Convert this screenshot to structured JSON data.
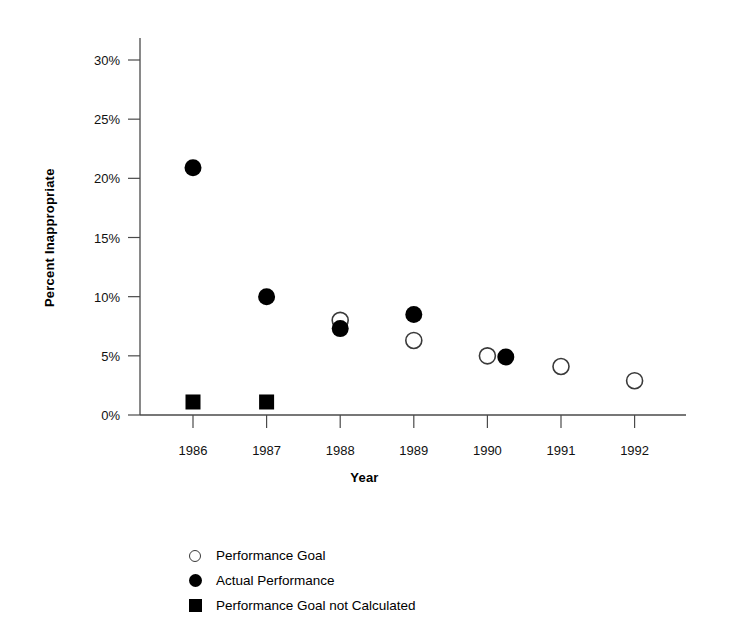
{
  "chart_data": {
    "type": "scatter",
    "title": "",
    "xlabel": "Year",
    "ylabel": "Percent Inappropriate",
    "x": [
      1986,
      1987,
      1988,
      1989,
      1990,
      1991,
      1992
    ],
    "categories": [
      "1986",
      "1987",
      "1988",
      "1989",
      "1990",
      "1991",
      "1992"
    ],
    "xlim": [
      1985.5,
      1992.6
    ],
    "ylim": [
      0,
      30
    ],
    "y_ticks": [
      0,
      5,
      10,
      15,
      20,
      25,
      30
    ],
    "y_tick_labels": [
      "0%",
      "5%",
      "10%",
      "15%",
      "20%",
      "25%",
      "30%"
    ],
    "x_ticks": [
      1986,
      1987,
      1988,
      1989,
      1990,
      1991,
      1992
    ],
    "x_tick_labels": [
      "1986",
      "1987",
      "1988",
      "1989",
      "1990",
      "1991",
      "1992"
    ],
    "grid": false,
    "legend_position": "bottom-left",
    "series": [
      {
        "name": "Performance Goal",
        "marker": "open-circle",
        "color": "#3a3a3a",
        "points": [
          {
            "x": 1988,
            "y": 8.0
          },
          {
            "x": 1989,
            "y": 6.3
          },
          {
            "x": 1990,
            "y": 5.0
          },
          {
            "x": 1991,
            "y": 4.1
          },
          {
            "x": 1992,
            "y": 2.9
          }
        ]
      },
      {
        "name": "Actual Performance",
        "marker": "filled-circle",
        "color": "#000000",
        "points": [
          {
            "x": 1986,
            "y": 20.9
          },
          {
            "x": 1987,
            "y": 10.0
          },
          {
            "x": 1988,
            "y": 7.3
          },
          {
            "x": 1989,
            "y": 8.5
          },
          {
            "x": 1990.25,
            "y": 4.9
          }
        ]
      },
      {
        "name": "Performance Goal not Calculated",
        "marker": "filled-square",
        "color": "#000000",
        "points": [
          {
            "x": 1986,
            "y": 1.1
          },
          {
            "x": 1987,
            "y": 1.1
          }
        ]
      }
    ]
  },
  "axes": {
    "y_title": "Percent Inappropriate",
    "x_title": "Year",
    "y_tick_labels": [
      "30%",
      "25%",
      "20%",
      "15%",
      "10%",
      "5%",
      "0%"
    ],
    "x_tick_labels": [
      "1986",
      "1987",
      "1988",
      "1989",
      "1990",
      "1991",
      "1992"
    ]
  },
  "legend": {
    "items": [
      {
        "label": "Performance Goal",
        "marker": "open-circle-icon"
      },
      {
        "label": "Actual Performance",
        "marker": "filled-circle-icon"
      },
      {
        "label": "Performance Goal not Calculated",
        "marker": "filled-square-icon"
      }
    ]
  },
  "colors": {
    "background": "#ffffff",
    "axis": "#4a4a4a",
    "marker_fill": "#000000",
    "marker_outline": "#3a3a3a",
    "text": "#000000"
  }
}
